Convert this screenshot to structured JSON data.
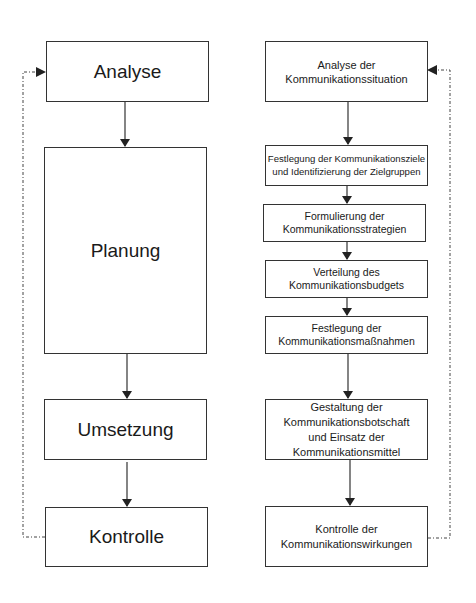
{
  "left_flow": {
    "steps": [
      {
        "label": "Analyse"
      },
      {
        "label": "Planung"
      },
      {
        "label": "Umsetzung"
      },
      {
        "label": "Kontrolle"
      }
    ],
    "feedback": "dotted loop from Kontrolle back to Analyse"
  },
  "right_flow": {
    "steps": [
      {
        "lines": [
          "Analyse der",
          "Kommunikationssituation"
        ]
      },
      {
        "lines": [
          "Festlegung der Kommunikationsziele",
          "und Identifizierung der Zielgruppen"
        ]
      },
      {
        "lines": [
          "Formulierung der",
          "Kommunikationsstrategien"
        ]
      },
      {
        "lines": [
          "Verteilung des",
          "Kommunikationsbudgets"
        ]
      },
      {
        "lines": [
          "Festlegung der",
          "Kommunikationsmaßnahmen"
        ]
      },
      {
        "lines": [
          "Gestaltung der",
          "Kommunikationsbotschaft",
          "und Einsatz der",
          "Kommunikationsmittel"
        ]
      },
      {
        "lines": [
          "Kontrolle der",
          "Kommunikationswirkungen"
        ]
      }
    ],
    "feedback": "dotted loop from Kontrolle der Kommunikationswirkungen back to Analyse der Kommunikationssituation"
  },
  "colors": {
    "line": "#333333",
    "text": "#1a1a1a",
    "background": "#ffffff"
  }
}
